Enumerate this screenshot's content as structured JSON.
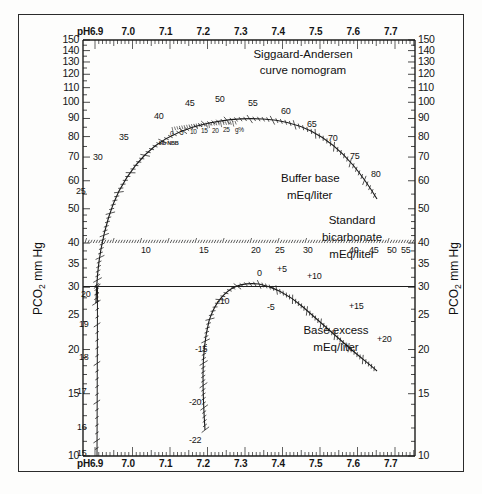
{
  "figure": {
    "title_line1": "Siggaard-Andersen",
    "title_line2": "curve nomogram",
    "y_axis_label_left_pre": "PCO",
    "y_axis_label_left_sub": "2",
    "y_axis_label_left_post": " mm Hg",
    "y_axis_label_right_pre": "PCO",
    "y_axis_label_right_sub": "2",
    "y_axis_label_right_post": " mm Hg",
    "ph_prefix_top": "pH6.9",
    "ph_prefix_bottom": "pH6.9",
    "annotations": {
      "buffer_base_line1": "Buffer base",
      "buffer_base_line2": "mEq/liter",
      "std_bicarb_line1": "Standard",
      "std_bicarb_line2": "bicarbonate",
      "std_bicarb_line3": "mEq/liter",
      "base_excess_line1": "Base excess",
      "base_excess_line2": "mEq/liter",
      "hb_scale_label": "Hb NBB",
      "hb_unit": "g%"
    }
  },
  "chart_data": {
    "type": "line",
    "title": "Siggaard-Andersen curve nomogram",
    "xlabel": "pH",
    "ylabel": "PCO2 mm Hg",
    "xlim": [
      6.85,
      7.79
    ],
    "ylim": [
      10,
      150
    ],
    "yscale": "log",
    "grid": false,
    "legend": "none",
    "x_ticks_labeled": [
      "6.9",
      "7.0",
      "7.1",
      "7.2",
      "7.3",
      "7.4",
      "7.5",
      "7.6",
      "7.7"
    ],
    "x_ticks_values": [
      6.9,
      7.0,
      7.1,
      7.2,
      7.3,
      7.4,
      7.5,
      7.6,
      7.7
    ],
    "x_minor_tick_step": 0.01,
    "y_ticks_labeled": [
      150,
      140,
      130,
      120,
      110,
      100,
      90,
      80,
      70,
      60,
      50,
      40,
      35,
      30,
      25,
      20,
      15,
      10
    ],
    "series": [
      {
        "name": "Buffer base mEq/liter",
        "labels": [
          "25",
          "30",
          "35",
          "40",
          "45",
          "50",
          "55",
          "60",
          "65",
          "70",
          "75",
          "80"
        ],
        "label_values": [
          25,
          30,
          35,
          40,
          45,
          50,
          55,
          60,
          65,
          70,
          75,
          80
        ],
        "points_ph_pco2": [
          [
            6.928,
            38
          ],
          [
            6.935,
            48
          ],
          [
            6.952,
            58
          ],
          [
            6.975,
            66
          ],
          [
            7.0,
            73
          ],
          [
            7.03,
            79
          ],
          [
            7.065,
            85
          ],
          [
            7.105,
            89
          ],
          [
            7.15,
            92
          ],
          [
            7.2,
            94
          ],
          [
            7.25,
            95
          ],
          [
            7.3,
            94
          ],
          [
            7.35,
            92
          ],
          [
            7.4,
            88
          ],
          [
            7.45,
            83
          ],
          [
            7.5,
            78
          ],
          [
            7.545,
            72
          ],
          [
            7.575,
            67
          ]
        ]
      },
      {
        "name": "Standard bicarbonate mEq/liter",
        "axis": "PCO2 = 40 horizontal line",
        "labels": [
          "10",
          "15",
          "20",
          "25",
          "30",
          "40",
          "45",
          "50",
          "55"
        ],
        "label_values": [
          10,
          15,
          20,
          25,
          30,
          40,
          45,
          50,
          55
        ]
      },
      {
        "name": "Base excess mEq/liter",
        "labels": [
          "0",
          "+5",
          "+10",
          "+15",
          "+20",
          "-5",
          "-10",
          "-15",
          "-20",
          "-22"
        ],
        "label_values": [
          0,
          5,
          10,
          15,
          20,
          -5,
          -10,
          -15,
          -20,
          -22
        ],
        "points_ph_pco2": [
          [
            7.225,
            12
          ],
          [
            7.232,
            18
          ],
          [
            7.238,
            25
          ],
          [
            7.25,
            31
          ],
          [
            7.268,
            35
          ],
          [
            7.295,
            38
          ],
          [
            7.33,
            40
          ],
          [
            7.4,
            40
          ],
          [
            7.45,
            38
          ],
          [
            7.5,
            35
          ],
          [
            7.545,
            31
          ],
          [
            7.575,
            28
          ]
        ]
      },
      {
        "name": "Buffer base low tail (vertical)",
        "labels": [
          "20",
          "19",
          "18",
          "17",
          "16",
          "15"
        ],
        "label_values": [
          20,
          19,
          18,
          17,
          16,
          15
        ],
        "points_ph_pco2": [
          [
            6.933,
            40
          ],
          [
            6.931,
            32
          ],
          [
            6.93,
            25
          ],
          [
            6.929,
            19
          ],
          [
            6.928,
            14
          ],
          [
            6.927,
            10
          ]
        ]
      },
      {
        "name": "Hb NBB scale",
        "labels": [
          "0",
          "5",
          "10",
          "15",
          "20",
          "25",
          "g%"
        ],
        "label_values": [
          0,
          5,
          10,
          15,
          20,
          25
        ]
      }
    ]
  }
}
